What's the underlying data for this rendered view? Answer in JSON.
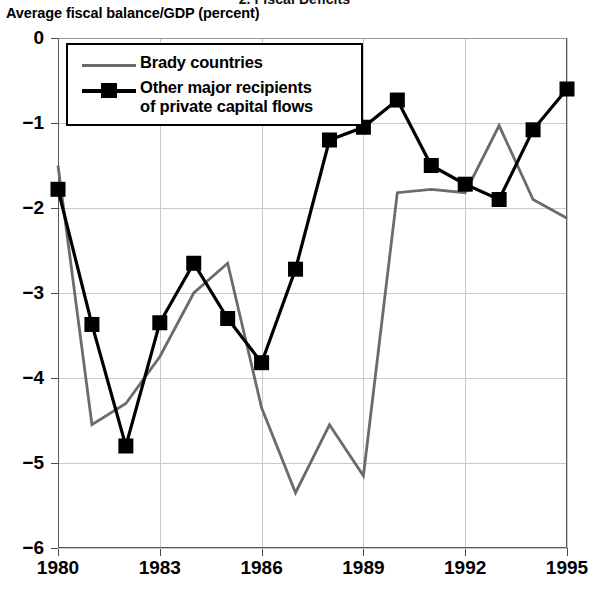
{
  "figure": {
    "title": "2. Fiscal Deficits",
    "axis_title": "Average fiscal balance/GDP (percent)"
  },
  "legend": {
    "items": [
      {
        "label": "Brady countries",
        "key": "line",
        "color": "#6b6b6b"
      },
      {
        "label": "Other major recipients\nof private capital flows",
        "key": "line-square",
        "color": "#000000"
      }
    ]
  },
  "chart_data": {
    "type": "line",
    "title": "2. Fiscal Deficits",
    "xlabel": "",
    "ylabel": "Average fiscal balance/GDP (percent)",
    "x": [
      1980,
      1981,
      1982,
      1983,
      1984,
      1985,
      1986,
      1987,
      1988,
      1989,
      1990,
      1991,
      1992,
      1993,
      1994,
      1995
    ],
    "xlim": [
      1980,
      1995
    ],
    "ylim": [
      -6,
      0
    ],
    "xticks": [
      1980,
      1983,
      1986,
      1989,
      1992,
      1995
    ],
    "xtick_labels": [
      "1980",
      "1983",
      "1986",
      "1989",
      "1992",
      "1995"
    ],
    "yticks": [
      0,
      -1,
      -2,
      -3,
      -4,
      -5,
      -6
    ],
    "ytick_labels": [
      "0",
      "−1",
      "−2",
      "−3",
      "−4",
      "−5",
      "−6"
    ],
    "grid": true,
    "legend_position": "upper left",
    "series": [
      {
        "name": "Brady countries",
        "color": "#6b6b6b",
        "marker": "none",
        "values": [
          -1.5,
          -4.55,
          -4.3,
          -3.75,
          -3.0,
          -2.65,
          -4.35,
          -5.35,
          -4.55,
          -5.15,
          -1.82,
          -1.78,
          -1.82,
          -1.03,
          -1.9,
          -2.12
        ]
      },
      {
        "name": "Other major recipients of private capital flows",
        "color": "#000000",
        "marker": "square",
        "values": [
          -1.78,
          -3.37,
          -4.8,
          -3.35,
          -2.65,
          -3.3,
          -3.82,
          -2.72,
          -1.2,
          -1.05,
          -0.73,
          -1.5,
          -1.72,
          -1.9,
          -1.08,
          -0.6
        ]
      }
    ]
  }
}
